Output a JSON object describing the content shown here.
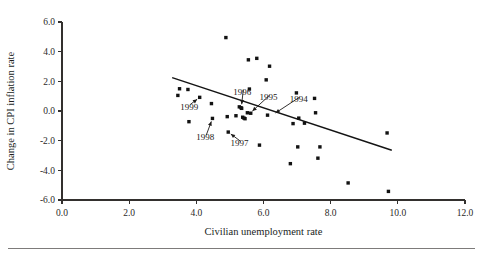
{
  "figure": {
    "background_color": "#ffffff",
    "ink_color": "#141414"
  },
  "chart_data": {
    "type": "scatter",
    "title": "",
    "xlabel": "Civilian unemployment rate",
    "ylabel": "Change in CPI inflation rate",
    "xlim": [
      0.0,
      12.0
    ],
    "ylim": [
      -6.0,
      6.0
    ],
    "xticks": [
      0.0,
      2.0,
      4.0,
      6.0,
      8.0,
      10.0,
      12.0
    ],
    "yticks": [
      -6.0,
      -4.0,
      -2.0,
      0.0,
      2.0,
      4.0,
      6.0
    ],
    "xtick_labels": [
      "0.0",
      "2.0",
      "4.0",
      "6.0",
      "8.0",
      "10.0",
      "12.0"
    ],
    "ytick_labels": [
      "-6.0",
      "-4.0",
      "-2.0",
      "0.0",
      "2.0",
      "4.0",
      "6.0"
    ],
    "grid": false,
    "legend": null,
    "marker": "filled-square",
    "points": [
      {
        "x": 3.45,
        "y": 1.05
      },
      {
        "x": 3.5,
        "y": 1.5
      },
      {
        "x": 3.75,
        "y": 1.45
      },
      {
        "x": 3.78,
        "y": -0.72
      },
      {
        "x": 4.1,
        "y": 0.92
      },
      {
        "x": 4.45,
        "y": 0.5
      },
      {
        "x": 4.48,
        "y": -0.5
      },
      {
        "x": 4.88,
        "y": 4.95
      },
      {
        "x": 4.92,
        "y": -0.38
      },
      {
        "x": 4.95,
        "y": -1.42
      },
      {
        "x": 5.18,
        "y": -0.32
      },
      {
        "x": 5.28,
        "y": 0.28
      },
      {
        "x": 5.33,
        "y": 0.22
      },
      {
        "x": 5.35,
        "y": 0.18
      },
      {
        "x": 5.38,
        "y": -0.42
      },
      {
        "x": 5.42,
        "y": -0.48
      },
      {
        "x": 5.45,
        "y": -0.52
      },
      {
        "x": 5.52,
        "y": -0.12
      },
      {
        "x": 5.55,
        "y": 3.45
      },
      {
        "x": 5.58,
        "y": 1.48
      },
      {
        "x": 5.62,
        "y": -0.15
      },
      {
        "x": 5.8,
        "y": 3.55
      },
      {
        "x": 5.88,
        "y": -2.3
      },
      {
        "x": 6.08,
        "y": 2.1
      },
      {
        "x": 6.12,
        "y": -0.28
      },
      {
        "x": 6.18,
        "y": 3.02
      },
      {
        "x": 6.8,
        "y": -3.55
      },
      {
        "x": 6.88,
        "y": -0.85
      },
      {
        "x": 6.98,
        "y": 1.22
      },
      {
        "x": 7.02,
        "y": -2.42
      },
      {
        "x": 7.05,
        "y": -0.48
      },
      {
        "x": 7.22,
        "y": -0.82
      },
      {
        "x": 7.52,
        "y": 0.85
      },
      {
        "x": 7.55,
        "y": -0.12
      },
      {
        "x": 7.62,
        "y": -3.18
      },
      {
        "x": 7.68,
        "y": -2.42
      },
      {
        "x": 8.52,
        "y": -4.85
      },
      {
        "x": 9.68,
        "y": -1.48
      },
      {
        "x": 9.72,
        "y": -5.42
      }
    ],
    "trend_line": {
      "x_start": 3.28,
      "y_start": 2.25,
      "x_end": 9.82,
      "y_end": -2.65
    },
    "annotations": [
      {
        "label": "1999",
        "label_x": 3.52,
        "label_y": 0.1,
        "point_x": 4.1,
        "point_y": 0.92
      },
      {
        "label": "1998",
        "label_x": 4.0,
        "label_y": -1.95,
        "point_x": 4.48,
        "point_y": -0.5
      },
      {
        "label": "1997",
        "label_x": 5.02,
        "label_y": -2.38,
        "point_x": 4.95,
        "point_y": -1.42
      },
      {
        "label": "1996",
        "label_x": 5.1,
        "label_y": 1.08,
        "point_x": 5.34,
        "point_y": 0.24
      },
      {
        "label": "1995",
        "label_x": 5.88,
        "label_y": 0.72,
        "point_x": 5.6,
        "point_y": -0.15
      },
      {
        "label": "1994",
        "label_x": 6.78,
        "label_y": 0.6,
        "point_x": 6.28,
        "point_y": -0.25
      }
    ]
  }
}
